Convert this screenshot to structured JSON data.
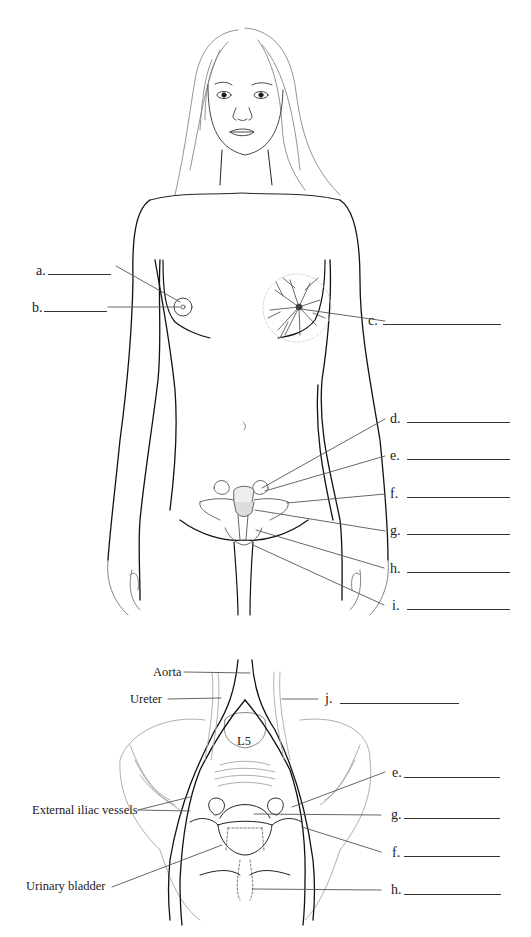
{
  "figure": {
    "top_view": "Female figure anterior view with breast and internal reproductive organs",
    "bottom_view": "Pelvic cavity anterior view"
  },
  "top_labels": {
    "a": "a.",
    "b": "b.",
    "c": "c.",
    "d": "d.",
    "e": "e.",
    "f": "f.",
    "g": "g.",
    "h": "h.",
    "i": "i."
  },
  "bottom_labels": {
    "aorta": "Aorta",
    "ureter": "Ureter",
    "j": "j.",
    "l5": "L5",
    "e": "e.",
    "external_iliac": "External iliac vessels",
    "g": "g.",
    "f": "f.",
    "urinary_bladder": "Urinary bladder",
    "h": "h."
  },
  "colors": {
    "line": "#1a1a1a",
    "leader": "#555555",
    "light_line": "#9a9a9a"
  }
}
